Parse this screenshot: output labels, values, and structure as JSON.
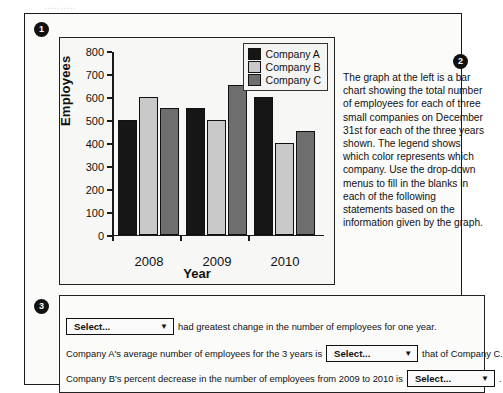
{
  "cut_off_line": "..........",
  "badges": {
    "one": "1",
    "two": "2",
    "three": "3"
  },
  "chart_data": {
    "type": "bar",
    "title": "",
    "xlabel": "Year",
    "ylabel": "Employees",
    "categories": [
      "2008",
      "2009",
      "2010"
    ],
    "ylim": [
      0,
      800
    ],
    "yticks": [
      "0",
      "100",
      "200",
      "300",
      "400",
      "500",
      "600",
      "700",
      "800"
    ],
    "grid": false,
    "legend_position": "top-right",
    "series": [
      {
        "name": "Company A",
        "color": "#161616",
        "values": [
          500,
          550,
          600
        ]
      },
      {
        "name": "Company B",
        "color": "#c9c9c9",
        "values": [
          600,
          500,
          400
        ]
      },
      {
        "name": "Company C",
        "color": "#6e6e6e",
        "values": [
          550,
          650,
          450
        ]
      }
    ]
  },
  "description": {
    "text": "The graph at the left is a bar chart showing the total number of employees for each of three small companies on December 31st for each of the three years shown. The legend shows which color represents which company. Use the drop-down menus to fill in the blanks in each of the following statements based on the information given by the graph."
  },
  "questions": {
    "select_label": "Select...",
    "caret": "▼",
    "q1": {
      "before": "",
      "after": "had greatest change in the number of employees for one year."
    },
    "q2": {
      "before": "Company A's average number of employees for the 3 years is",
      "after": "that of Company C."
    },
    "q3": {
      "before": "Company B's percent decrease in the number of employees from 2009 to 2010 is",
      "after": "."
    }
  }
}
